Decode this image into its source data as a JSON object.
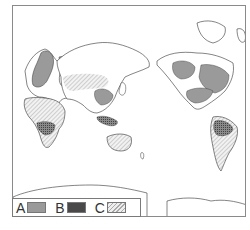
{
  "map": {
    "projection": "pacific-centered world map",
    "regions": [
      {
        "label": "A",
        "areas": [
          "Europe / Scandinavia",
          "Eastern China",
          "Western Canada",
          "Eastern Canada / NE United States",
          "Southern United States"
        ]
      },
      {
        "label": "B",
        "areas": [
          "Central Africa (Congo basin)",
          "Southeast Asia / Indonesia",
          "Amazon basin"
        ]
      },
      {
        "label": "C",
        "areas": [
          "Central Asia / Siberia",
          "North Africa",
          "Australia",
          "Southern South America"
        ]
      }
    ]
  },
  "legend": {
    "items": [
      {
        "label": "A",
        "pattern": "solid-gray",
        "color": "#9a9a9a"
      },
      {
        "label": "B",
        "pattern": "cross-hatch-dark",
        "color": "#6f6f6f"
      },
      {
        "label": "C",
        "pattern": "diagonal-hatch-light",
        "color": "#d8d8d8"
      }
    ]
  },
  "colors": {
    "coastline": "#333333",
    "region_a": "#9a9a9a",
    "region_b": "#6f6f6f",
    "region_c": "#cfcfcf",
    "frame": "#8a8a8a"
  }
}
